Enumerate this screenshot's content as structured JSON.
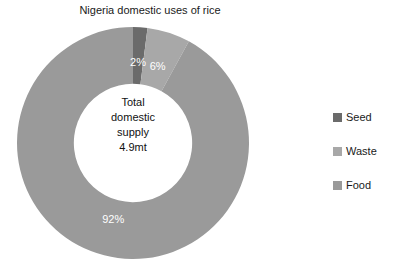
{
  "chart_data": {
    "type": "pie",
    "variant": "donut",
    "title": "Nigeria domestic uses of rice",
    "xlabel": "",
    "ylabel": "",
    "grid": false,
    "legend_position": "right",
    "start_angle_deg": 0,
    "direction": "clockwise",
    "inner_radius_ratio": 0.51,
    "categories": [
      "Seed",
      "Waste",
      "Food"
    ],
    "values": [
      2,
      6,
      92
    ],
    "value_unit": "%",
    "data_labels": [
      "2%",
      "6%",
      "92%"
    ],
    "colors": [
      "#6b6b6b",
      "#a8a8a8",
      "#9a9a9a"
    ],
    "center_annotation": [
      "Total",
      "domestic",
      "supply",
      "4.9mt"
    ]
  },
  "title": "Nigeria domestic uses of rice",
  "center": {
    "line1": "Total",
    "line2": "domestic",
    "line3": "supply",
    "line4": "4.9mt"
  },
  "slices": [
    {
      "label": "Seed",
      "percent": 2,
      "data_label": "2%",
      "color": "#6b6b6b"
    },
    {
      "label": "Waste",
      "percent": 6,
      "data_label": "6%",
      "color": "#a8a8a8"
    },
    {
      "label": "Food",
      "percent": 92,
      "data_label": "92%",
      "color": "#9a9a9a"
    }
  ],
  "legend": {
    "items": [
      {
        "label": "Seed",
        "color": "#6b6b6b"
      },
      {
        "label": "Waste",
        "color": "#a8a8a8"
      },
      {
        "label": "Food",
        "color": "#9a9a9a"
      }
    ]
  }
}
